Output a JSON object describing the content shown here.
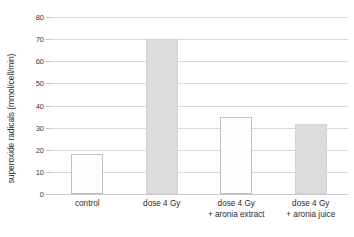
{
  "chart_data": {
    "type": "bar",
    "title": "",
    "subtitle": "",
    "xlabel": "",
    "ylabel": "superoxide radicals (mmol/cell/min)",
    "ylim": [
      0,
      80
    ],
    "ytick_step": 10,
    "yticks": [
      "80",
      "70",
      "60",
      "50",
      "40",
      "30",
      "20",
      "10",
      "0"
    ],
    "ytick_values": [
      80,
      70,
      60,
      50,
      40,
      30,
      20,
      10,
      0
    ],
    "grid": "horizontal",
    "legend": "none",
    "categories": [
      "control",
      "dose 4 Gy",
      "dose 4 Gy + aronia extract",
      "dose 4 Gy + aronia juice"
    ],
    "category_lines": [
      [
        "control",
        ""
      ],
      [
        "dose 4 Gy",
        ""
      ],
      [
        "dose 4 Gy",
        "+ aronia extract"
      ],
      [
        "dose 4 Gy",
        "+ aronia juice"
      ]
    ],
    "values": [
      18,
      70,
      35,
      31.5
    ],
    "bar_styles": [
      "light",
      "gray",
      "light",
      "gray"
    ],
    "colors": {
      "bar_light_fill": "#fdfdfd",
      "bar_light_edge": "#bfbfbf",
      "bar_gray_fill": "#dcdcdc",
      "bar_gray_edge": "#d2d2d2",
      "gridline": "#d9d9d9",
      "axis_text": "#2b2b2b",
      "background": "#ffffff"
    }
  }
}
